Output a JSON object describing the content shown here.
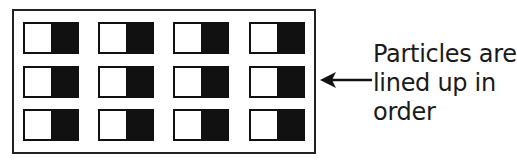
{
  "diagram": {
    "type": "particle-alignment",
    "grid": {
      "rows": 3,
      "columns": 4
    },
    "particle": {
      "left_color": "#ffffff",
      "right_color": "#111111"
    },
    "label": {
      "lines": [
        "Particles are",
        "lined up in",
        "order"
      ]
    },
    "arrow": {
      "direction": "left"
    }
  }
}
